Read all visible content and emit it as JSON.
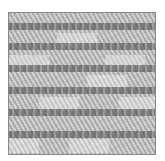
{
  "image": {
    "subject": "needlepoint-fabric-swatch",
    "pattern": "stepped-brick-weave",
    "colors": {
      "background": "#ffffff",
      "border": "#8a8a8a",
      "base": "#b9b9b9",
      "dark_stitch": "#5d5d5d",
      "light_stitch": "#e6e6e6"
    },
    "bands": [
      {
        "top": 10
      },
      {
        "top": 30
      },
      {
        "top": 52
      },
      {
        "top": 74
      },
      {
        "top": 96
      },
      {
        "top": 118
      }
    ],
    "light_blocks": [
      {
        "left": 0,
        "top": 42,
        "width": 40,
        "height": 14
      },
      {
        "left": 48,
        "top": 20,
        "width": 40,
        "height": 14
      },
      {
        "left": 96,
        "top": 42,
        "width": 40,
        "height": 14
      },
      {
        "left": 30,
        "top": 84,
        "width": 40,
        "height": 14
      },
      {
        "left": 78,
        "top": 62,
        "width": 40,
        "height": 14
      },
      {
        "left": 110,
        "top": 84,
        "width": 38,
        "height": 14
      },
      {
        "left": 0,
        "top": 126,
        "width": 30,
        "height": 14
      },
      {
        "left": 60,
        "top": 126,
        "width": 40,
        "height": 14
      }
    ]
  }
}
